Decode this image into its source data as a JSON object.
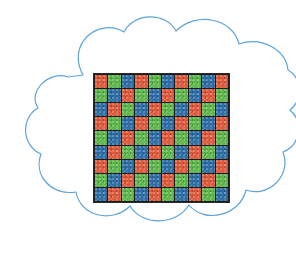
{
  "figure": {
    "title": "",
    "background_color": "#ffffff",
    "width": 296,
    "height": 263
  },
  "cloud": {
    "name": "cloud-outline",
    "stroke_color": "#5BA3DC",
    "fill_color": "#ffffff",
    "stroke_width": 1.2,
    "clipped_right_edge": true,
    "lobe_count": 9
  },
  "sensor_grid": {
    "label": "rgb-pixel-sensor-grid",
    "columns": 10,
    "rows": 9,
    "gridline_color": "#1c1c1c",
    "border_color": "#2a2a2a",
    "pattern": "diagonal-rgb-stripe",
    "colors": {
      "R": "#E05B3C",
      "G": "#5FB84C",
      "B": "#2E6FA8"
    },
    "color_names": {
      "R": "red",
      "G": "green",
      "B": "blue"
    },
    "cells": [
      [
        "R",
        "G",
        "B",
        "R",
        "G",
        "B",
        "R",
        "G",
        "B",
        "R"
      ],
      [
        "G",
        "B",
        "R",
        "G",
        "B",
        "R",
        "G",
        "B",
        "R",
        "G"
      ],
      [
        "B",
        "R",
        "G",
        "B",
        "R",
        "G",
        "B",
        "R",
        "G",
        "B"
      ],
      [
        "R",
        "G",
        "B",
        "R",
        "G",
        "B",
        "R",
        "G",
        "B",
        "R"
      ],
      [
        "G",
        "B",
        "R",
        "G",
        "B",
        "R",
        "G",
        "B",
        "R",
        "G"
      ],
      [
        "B",
        "R",
        "G",
        "B",
        "R",
        "G",
        "B",
        "R",
        "G",
        "B"
      ],
      [
        "R",
        "G",
        "B",
        "R",
        "G",
        "B",
        "R",
        "G",
        "B",
        "R"
      ],
      [
        "G",
        "B",
        "R",
        "G",
        "B",
        "R",
        "G",
        "B",
        "R",
        "G"
      ],
      [
        "B",
        "R",
        "G",
        "B",
        "R",
        "G",
        "B",
        "R",
        "G",
        "B"
      ]
    ]
  }
}
